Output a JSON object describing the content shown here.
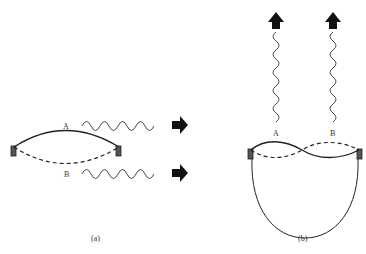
{
  "diagram": {
    "panels": [
      {
        "id": "a",
        "caption": "(a)",
        "modes": [
          {
            "label": "A",
            "style": "solid",
            "description": "upward bowed string"
          },
          {
            "label": "B",
            "style": "dashed",
            "description": "downward bowed string"
          }
        ],
        "waves": [
          {
            "label": "A",
            "direction": "right"
          },
          {
            "label": "B",
            "direction": "right"
          }
        ]
      },
      {
        "id": "b",
        "caption": "(b)",
        "modes": [
          {
            "label": "A",
            "style": "solid"
          },
          {
            "label": "B",
            "style": "dashed"
          }
        ],
        "waves": [
          {
            "label": "A",
            "direction": "up"
          },
          {
            "label": "B",
            "direction": "up"
          }
        ],
        "enclosure": "closed bowl beneath string"
      }
    ],
    "colors": {
      "line": "#222222",
      "arrow": "#111111",
      "clamp": "#444444"
    }
  }
}
